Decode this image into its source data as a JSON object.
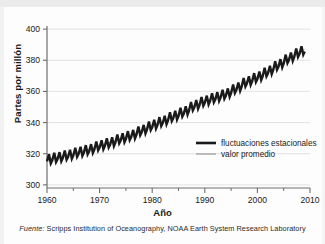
{
  "chart_data": {
    "type": "line",
    "title": "",
    "xlabel": "Año",
    "ylabel": "Partes por millón",
    "xlim": [
      1960,
      2010
    ],
    "ylim": [
      298,
      402
    ],
    "xticks": [
      1960,
      1970,
      1980,
      1990,
      2000,
      2010
    ],
    "xtick_labels": [
      "1960",
      "1970",
      "1980",
      "1990",
      "2000",
      "2010"
    ],
    "xminor_ticks": [
      1965,
      1975,
      1985,
      1995,
      2005
    ],
    "yticks": [
      300,
      320,
      340,
      360,
      380,
      400
    ],
    "ytick_labels": [
      "300",
      "320",
      "340",
      "360",
      "380",
      "400"
    ],
    "grid": "horizontal",
    "legend_position": "center-right",
    "series": [
      {
        "name": "fluctuaciones estacionales",
        "color": "#1a1a1a",
        "width": 2.4,
        "style": "seasonal-sawtooth",
        "seasonal_amplitude_ppm": 3.1,
        "cycles_per_year": 1
      },
      {
        "name": "valor promedio",
        "color": "#9a9a9a",
        "width": 1.0,
        "style": "smooth-trend"
      }
    ],
    "x": [
      1960,
      1962,
      1964,
      1966,
      1968,
      1970,
      1972,
      1974,
      1976,
      1978,
      1980,
      1982,
      1984,
      1986,
      1988,
      1990,
      1992,
      1994,
      1996,
      1998,
      2000,
      2002,
      2004,
      2006,
      2008,
      2009
    ],
    "trend_values": [
      316.5,
      317.8,
      319.3,
      321.2,
      322.8,
      325.4,
      327.2,
      329.8,
      331.9,
      335.1,
      338.4,
      341.0,
      344.2,
      347.0,
      351.1,
      354.0,
      356.2,
      358.5,
      362.2,
      366.4,
      369.3,
      372.9,
      377.2,
      381.5,
      385.4,
      387.0
    ],
    "annotations": [],
    "source_prefix": "Fuente:",
    "source_text": "Scripps Institution of Oceanography, NOAA Earth System Research Laboratory"
  },
  "axis": {
    "ylabel": "Partes por millón",
    "xlabel": "Año"
  },
  "legend": {
    "item1": "fluctuaciones estacionales",
    "item2": "valor promedio"
  },
  "footer": {
    "prefix": "Fuente:",
    "text": "Scripps Institution of Oceanography, NOAA Earth System Research Laboratory"
  }
}
